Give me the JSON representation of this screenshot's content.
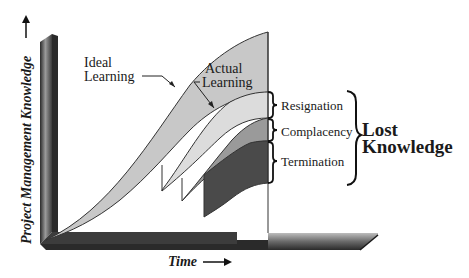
{
  "diagram": {
    "y_axis_label": "Project Management Knowledge",
    "x_axis_label": "Time",
    "curves": {
      "ideal": {
        "label_line1": "Ideal",
        "label_line2": "Learning",
        "color": "#c8c8c8"
      },
      "actual": {
        "label_line1": "Actual",
        "label_line2": "Learning",
        "color": "#dcdcdc"
      }
    },
    "losses": [
      {
        "label": "Resignation",
        "color": "#dcdcdc"
      },
      {
        "label": "Complacency",
        "color": "#9a9a9a"
      },
      {
        "label": "Termination",
        "color": "#4a4a4a"
      }
    ],
    "summary": {
      "line1": "Lost",
      "line2": "Knowledge"
    }
  }
}
